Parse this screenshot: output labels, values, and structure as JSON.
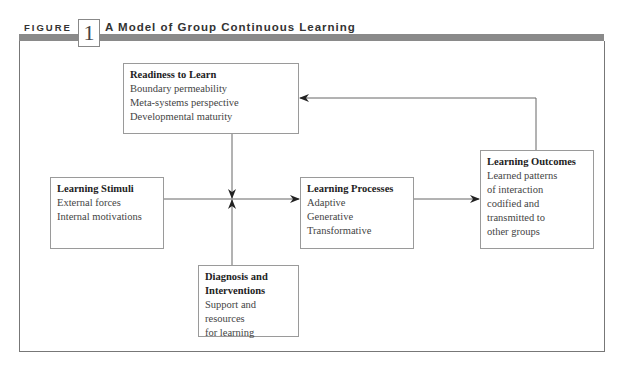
{
  "header": {
    "figure_label": "FIGURE",
    "figure_number": "1",
    "title": "A Model of Group Continuous Learning"
  },
  "boxes": {
    "readiness": {
      "title": "Readiness to Learn",
      "lines": [
        "Boundary permeability",
        "Meta-systems perspective",
        "Developmental maturity"
      ]
    },
    "stimuli": {
      "title": "Learning Stimuli",
      "lines": [
        "External forces",
        "Internal motivations"
      ]
    },
    "processes": {
      "title": "Learning Processes",
      "lines": [
        "Adaptive",
        "Generative",
        "Transformative"
      ]
    },
    "outcomes": {
      "title": "Learning Outcomes",
      "lines": [
        "Learned patterns",
        "of interaction",
        "codified and",
        "transmitted to",
        "other groups"
      ]
    },
    "diagnosis": {
      "title_lines": [
        "Diagnosis and",
        "Interventions"
      ],
      "lines": [
        "Support and resources",
        "for learning"
      ]
    }
  },
  "connections": [
    {
      "from": "stimuli",
      "to": "processes",
      "type": "arrow"
    },
    {
      "from": "readiness",
      "to": "stimuli-processes-link",
      "type": "arrow-down"
    },
    {
      "from": "diagnosis",
      "to": "stimuli-processes-link",
      "type": "arrow-up"
    },
    {
      "from": "processes",
      "to": "outcomes",
      "type": "arrow"
    },
    {
      "from": "outcomes",
      "to": "readiness",
      "type": "feedback-arrow"
    }
  ],
  "colors": {
    "bar": "#8a8a8a",
    "border": "#9a9a9a",
    "text": "#444444"
  }
}
